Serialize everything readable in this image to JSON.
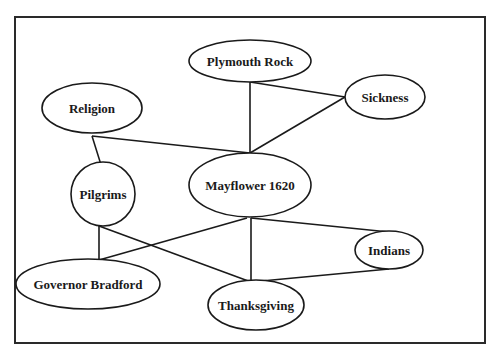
{
  "diagram": {
    "type": "concept-map",
    "frame": {
      "x": 15,
      "y": 17,
      "width": 470,
      "height": 326
    },
    "nodes": [
      {
        "id": "plymouth-rock",
        "label": "Plymouth Rock",
        "cx": 250,
        "cy": 61,
        "rx": 61,
        "ry": 21
      },
      {
        "id": "sickness",
        "label": "Sickness",
        "cx": 385,
        "cy": 97,
        "rx": 40,
        "ry": 22
      },
      {
        "id": "religion",
        "label": "Religion",
        "cx": 92,
        "cy": 108,
        "rx": 50,
        "ry": 25
      },
      {
        "id": "mayflower-1620",
        "label": "Mayflower 1620",
        "cx": 250,
        "cy": 185,
        "rx": 61,
        "ry": 32
      },
      {
        "id": "pilgrims",
        "label": "Pilgrims",
        "cx": 103,
        "cy": 194,
        "rx": 32,
        "ry": 32
      },
      {
        "id": "indians",
        "label": "Indians",
        "cx": 389,
        "cy": 250,
        "rx": 34,
        "ry": 19
      },
      {
        "id": "governor-bradford",
        "label": "Governor Bradford",
        "cx": 88,
        "cy": 284,
        "rx": 72,
        "ry": 25
      },
      {
        "id": "thanksgiving",
        "label": "Thanksgiving",
        "cx": 256,
        "cy": 305,
        "rx": 48,
        "ry": 25
      }
    ],
    "edges": [
      {
        "from": "plymouth-rock",
        "to": "mayflower-1620",
        "x1": 250,
        "y1": 82,
        "x2": 250,
        "y2": 153
      },
      {
        "from": "plymouth-rock",
        "to": "sickness",
        "x1": 250,
        "y1": 82,
        "x2": 345,
        "y2": 97
      },
      {
        "from": "sickness",
        "to": "mayflower-1620",
        "x1": 345,
        "y1": 97,
        "x2": 250,
        "y2": 153
      },
      {
        "from": "religion",
        "to": "mayflower-1620",
        "x1": 92,
        "y1": 136,
        "x2": 250,
        "y2": 153
      },
      {
        "from": "religion",
        "to": "pilgrims",
        "x1": 92,
        "y1": 136,
        "x2": 102,
        "y2": 168
      },
      {
        "from": "pilgrims",
        "to": "governor-bradford",
        "x1": 99,
        "y1": 226,
        "x2": 99,
        "y2": 260
      },
      {
        "from": "pilgrims",
        "to": "thanksgiving",
        "x1": 99,
        "y1": 226,
        "x2": 251,
        "y2": 282
      },
      {
        "from": "mayflower-1620",
        "to": "governor-bradford",
        "x1": 247,
        "y1": 218,
        "x2": 99,
        "y2": 260
      },
      {
        "from": "mayflower-1620",
        "to": "thanksgiving",
        "x1": 251,
        "y1": 218,
        "x2": 251,
        "y2": 282
      },
      {
        "from": "mayflower-1620",
        "to": "indians",
        "x1": 251,
        "y1": 218,
        "x2": 389,
        "y2": 232
      },
      {
        "from": "indians",
        "to": "thanksgiving",
        "x1": 389,
        "y1": 269,
        "x2": 251,
        "y2": 282
      }
    ]
  }
}
